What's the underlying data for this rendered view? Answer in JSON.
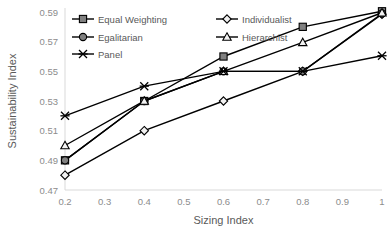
{
  "chart_data": {
    "type": "line",
    "title": "",
    "xlabel": "Sizing Index",
    "ylabel": "Sustainability Index",
    "x": [
      0.2,
      0.4,
      0.6,
      0.8,
      1.0
    ],
    "xtick_labels": [
      "0.2",
      "0.3",
      "0.4",
      "0.5",
      "0.6",
      "0.7",
      "0.8",
      "0.9",
      "1"
    ],
    "xtick_values": [
      0.2,
      0.3,
      0.4,
      0.5,
      0.6,
      0.7,
      0.8,
      0.9,
      1.0
    ],
    "ytick_labels": [
      "0.47",
      "0.49",
      "0.51",
      "0.53",
      "0.55",
      "0.57",
      "0.59"
    ],
    "ytick_values": [
      0.47,
      0.49,
      0.51,
      0.53,
      0.55,
      0.57,
      0.59
    ],
    "xlim": [
      0.2,
      1.0
    ],
    "ylim": [
      0.47,
      0.59
    ],
    "grid": false,
    "legend_position": "top-inside",
    "series": [
      {
        "name": "Equal Weighting",
        "marker": "square-filled",
        "values": [
          0.49,
          0.53,
          0.56,
          0.58,
          0.5905
        ]
      },
      {
        "name": "Individualist",
        "marker": "diamond",
        "values": [
          0.48,
          0.51,
          0.53,
          0.55,
          0.5885
        ]
      },
      {
        "name": "Egalitarian",
        "marker": "circle",
        "values": [
          0.49,
          0.53,
          0.55,
          0.55,
          0.589
        ]
      },
      {
        "name": "Hierarchist",
        "marker": "triangle",
        "values": [
          0.5,
          0.53,
          0.55,
          0.5695,
          0.5895
        ]
      },
      {
        "name": "Panel",
        "marker": "cross-star",
        "values": [
          0.52,
          0.54,
          0.55,
          0.55,
          0.5605
        ]
      }
    ]
  },
  "legend": {
    "items": [
      {
        "label": "Equal Weighting"
      },
      {
        "label": "Individualist"
      },
      {
        "label": "Egalitarian"
      },
      {
        "label": "Hierarchist"
      },
      {
        "label": "Panel"
      }
    ]
  },
  "colors": {
    "line": "#000000",
    "marker_dark": "#808080",
    "marker_light": "#f2f2f2",
    "axis": "#d9d9d9",
    "tick_text": "#8c8c8c",
    "title_text": "#595959",
    "background": "#ffffff"
  }
}
